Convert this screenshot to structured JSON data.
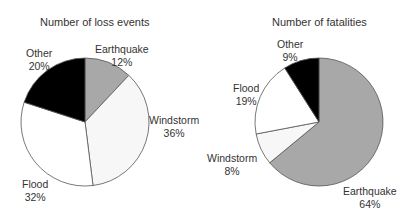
{
  "colors": {
    "earthquake": "#a8a8a8",
    "windstorm": "#f7f7f7",
    "flood": "#ffffff",
    "other": "#000000",
    "outline": "#555555"
  },
  "chart_data": [
    {
      "type": "pie",
      "title": "Number of loss events",
      "categories": [
        "Earthquake",
        "Windstorm",
        "Flood",
        "Other"
      ],
      "values": [
        12,
        36,
        32,
        20
      ],
      "unit": "%",
      "start_angle": "12 o'clock, clockwise"
    },
    {
      "type": "pie",
      "title": "Number of fatalities",
      "categories": [
        "Earthquake",
        "Windstorm",
        "Flood",
        "Other"
      ],
      "values": [
        64,
        8,
        19,
        9
      ],
      "unit": "%",
      "start_angle": "12 o'clock, clockwise"
    }
  ],
  "left": {
    "title": "Number of loss events",
    "labels": {
      "earthquake": {
        "name": "Earthquake",
        "pct": "12%"
      },
      "windstorm": {
        "name": "Windstorm",
        "pct": "36%"
      },
      "flood": {
        "name": "Flood",
        "pct": "32%"
      },
      "other": {
        "name": "Other",
        "pct": "20%"
      }
    }
  },
  "right": {
    "title": "Number of fatalities",
    "labels": {
      "earthquake": {
        "name": "Earthquake",
        "pct": "64%"
      },
      "windstorm": {
        "name": "Windstorm",
        "pct": "8%"
      },
      "flood": {
        "name": "Flood",
        "pct": "19%"
      },
      "other": {
        "name": "Other",
        "pct": "9%"
      }
    }
  }
}
